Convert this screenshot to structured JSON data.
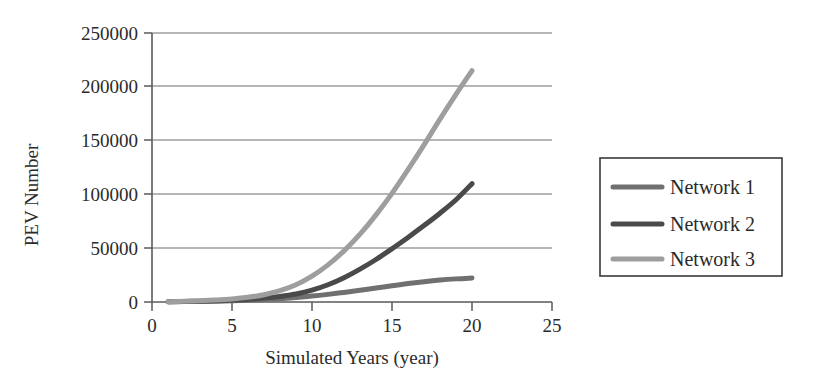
{
  "chart_data": {
    "type": "line",
    "title": "",
    "xlabel": "Simulated Years (year)",
    "ylabel": "PEV Number",
    "xlim": [
      0,
      25
    ],
    "ylim": [
      0,
      250000
    ],
    "xticks": [
      0,
      5,
      10,
      15,
      20,
      25
    ],
    "xtick_labels": [
      "0",
      "5",
      "10",
      "15",
      "20",
      "25"
    ],
    "yticks": [
      0,
      50000,
      100000,
      150000,
      200000,
      250000
    ],
    "ytick_labels": [
      "0",
      "50000",
      "100000",
      "150000",
      "200000",
      "250000"
    ],
    "grid": "horizontal",
    "legend_position": "right-outside",
    "x": [
      1,
      2,
      3,
      4,
      5,
      6,
      7,
      8,
      9,
      10,
      11,
      12,
      13,
      14,
      15,
      16,
      17,
      18,
      19,
      20
    ],
    "series": [
      {
        "name": "Network 1",
        "color": "#707070",
        "values": [
          200,
          350,
          550,
          800,
          1150,
          1600,
          2250,
          3100,
          4200,
          5500,
          7100,
          8900,
          10900,
          13000,
          15100,
          17100,
          18900,
          20400,
          21500,
          22300
        ]
      },
      {
        "name": "Network 2",
        "color": "#4a4a4a",
        "values": [
          250,
          450,
          750,
          1150,
          1700,
          2500,
          3600,
          5200,
          7500,
          11000,
          16000,
          22500,
          30500,
          39500,
          49500,
          60000,
          71000,
          82500,
          95000,
          110000
        ]
      },
      {
        "name": "Network 3",
        "color": "#9e9e9e",
        "values": [
          300,
          600,
          1050,
          1750,
          2800,
          4400,
          6800,
          10500,
          16000,
          24000,
          34500,
          47500,
          63000,
          81000,
          101000,
          123000,
          146000,
          170000,
          193000,
          215000
        ]
      }
    ]
  },
  "axes": {
    "ylabel": "PEV Number",
    "xlabel": "Simulated Years (year)",
    "xtick_labels": [
      "0",
      "5",
      "10",
      "15",
      "20",
      "25"
    ],
    "ytick_labels": [
      "0",
      "50000",
      "100000",
      "150000",
      "200000",
      "250000"
    ]
  },
  "legend": {
    "entries": [
      {
        "label": "Network 1",
        "color": "#707070"
      },
      {
        "label": "Network 2",
        "color": "#4a4a4a"
      },
      {
        "label": "Network 3",
        "color": "#9e9e9e"
      }
    ]
  }
}
